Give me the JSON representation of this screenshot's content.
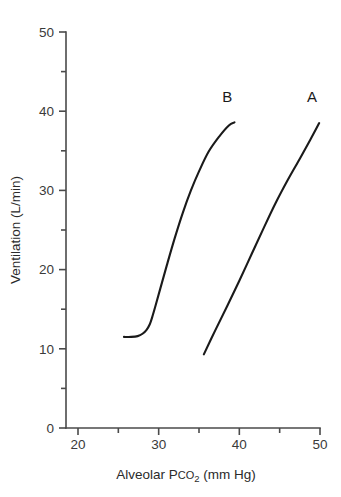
{
  "chart_data": {
    "type": "line",
    "title": "",
    "xlabel": "Alveolar Pco2 (mm Hg)",
    "xlabel_parts": {
      "prefix": "Alveolar P",
      "smallcaps": "CO",
      "subscript": "2",
      "suffix": " (mm Hg)"
    },
    "ylabel": "Ventilation (L/min)",
    "xlim": [
      20,
      50
    ],
    "ylim": [
      0,
      50
    ],
    "x_major_ticks": [
      20,
      30,
      40,
      50
    ],
    "x_minor_ticks": [
      25,
      35,
      45
    ],
    "x_tick_labels": [
      "20",
      "30",
      "40",
      "50"
    ],
    "y_major_ticks": [
      0,
      10,
      20,
      30,
      40,
      50
    ],
    "y_minor_ticks": [
      5,
      15,
      25,
      35,
      45
    ],
    "y_tick_labels": [
      "0",
      "10",
      "20",
      "30",
      "40",
      "50"
    ],
    "grid": false,
    "legend": "inline-curve-labels",
    "series": [
      {
        "name": "B",
        "label": "B",
        "label_point": [
          38.5,
          41.2
        ],
        "color": "#1a1a1a",
        "description": "Normal CO2 response curve with low-ventilation plateau and knee near 29 mm Hg",
        "points": [
          [
            25.7,
            11.5
          ],
          [
            26.6,
            11.5
          ],
          [
            27.4,
            11.6
          ],
          [
            28.0,
            11.9
          ],
          [
            28.5,
            12.4
          ],
          [
            28.9,
            13.1
          ],
          [
            29.2,
            14.0
          ],
          [
            29.6,
            15.4
          ],
          [
            30.2,
            17.6
          ],
          [
            31.0,
            20.5
          ],
          [
            32.0,
            24.0
          ],
          [
            33.0,
            27.2
          ],
          [
            34.0,
            30.0
          ],
          [
            35.0,
            32.4
          ],
          [
            36.2,
            34.9
          ],
          [
            37.5,
            36.8
          ],
          [
            38.7,
            38.2
          ],
          [
            39.4,
            38.6
          ]
        ]
      },
      {
        "name": "A",
        "label": "A",
        "label_point": [
          49.0,
          41.2
        ],
        "color": "#1a1a1a",
        "description": "Right-shifted, essentially linear CO2 response curve",
        "points": [
          [
            35.6,
            9.3
          ],
          [
            37.0,
            12.3
          ],
          [
            38.5,
            15.4
          ],
          [
            40.0,
            18.6
          ],
          [
            41.5,
            21.9
          ],
          [
            43.0,
            25.2
          ],
          [
            44.5,
            28.4
          ],
          [
            46.0,
            31.3
          ],
          [
            47.5,
            34.0
          ],
          [
            48.8,
            36.4
          ],
          [
            49.9,
            38.5
          ]
        ]
      }
    ]
  },
  "geometry": {
    "px_x_at_xmin": 78,
    "px_x_at_xmax": 320,
    "px_y_at_ymin": 428,
    "px_y_at_ymax": 32,
    "axis_x_px": 66,
    "axis_y_px": 428,
    "tick_major_len": 7,
    "tick_minor_len": 5
  },
  "colors": {
    "background": "#ffffff",
    "curve": "#1a1a1a",
    "axis": "#4a4a4a",
    "text": "#2b2b2b"
  }
}
